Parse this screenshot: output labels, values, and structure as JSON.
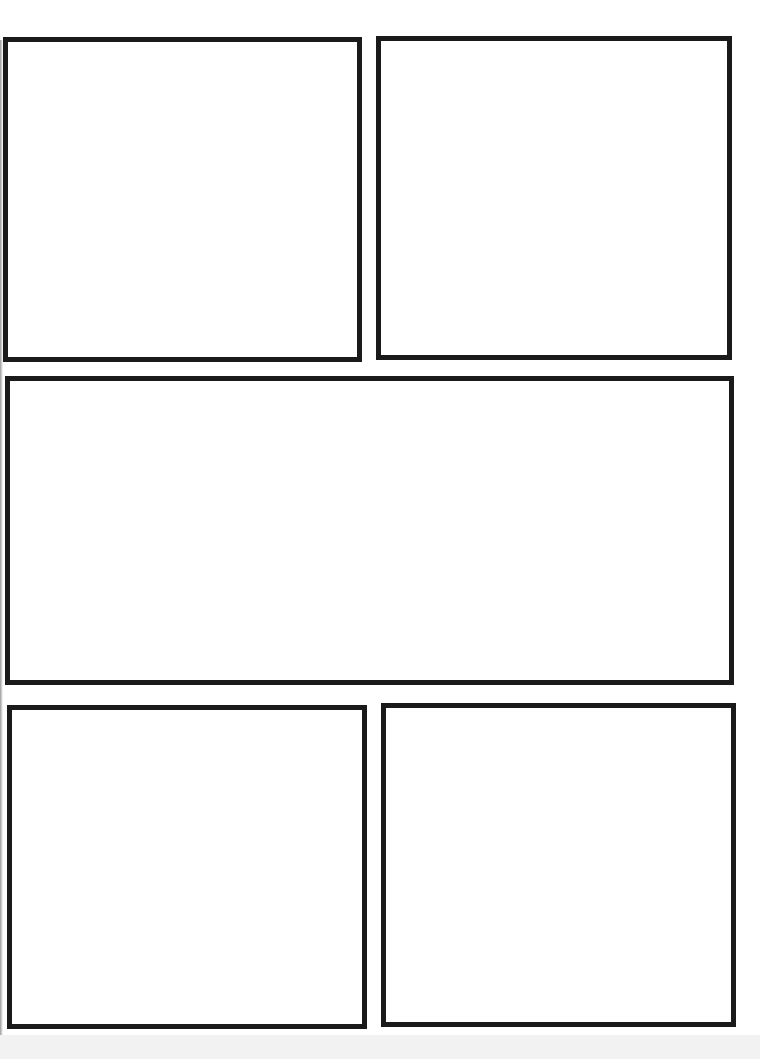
{
  "page": {
    "type": "comic-page-template",
    "background_color": "#ffffff",
    "border_color": "#1a1a1a",
    "panel_count": 5
  },
  "panels": [
    {
      "id": 1,
      "row": 1,
      "position": "top-left",
      "x": 3,
      "y": 37,
      "width": 359,
      "height": 325,
      "content": ""
    },
    {
      "id": 2,
      "row": 1,
      "position": "top-right",
      "x": 376,
      "y": 36,
      "width": 356,
      "height": 324,
      "content": ""
    },
    {
      "id": 3,
      "row": 2,
      "position": "middle-wide",
      "x": 5,
      "y": 376,
      "width": 729,
      "height": 309,
      "content": ""
    },
    {
      "id": 4,
      "row": 3,
      "position": "bottom-left",
      "x": 7,
      "y": 705,
      "width": 360,
      "height": 324,
      "content": ""
    },
    {
      "id": 5,
      "row": 3,
      "position": "bottom-right",
      "x": 381,
      "y": 703,
      "width": 355,
      "height": 324,
      "content": ""
    }
  ]
}
